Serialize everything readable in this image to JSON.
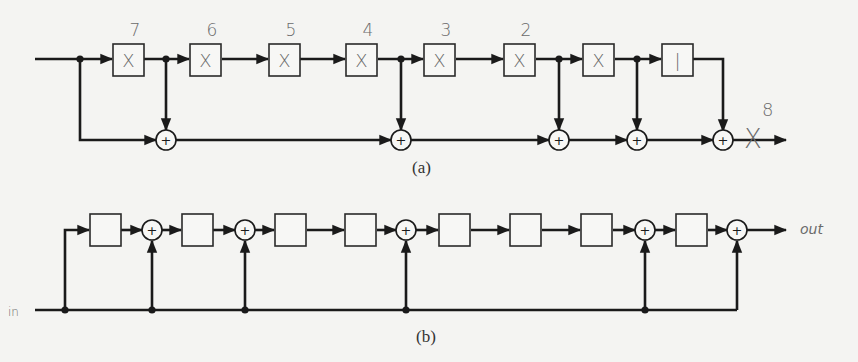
{
  "diagram_a": {
    "caption": "(a)",
    "input_y": 59,
    "bus_y": 140,
    "boxes": [
      {
        "x": 113,
        "label": "X",
        "annot": "7"
      },
      {
        "x": 190,
        "label": "X",
        "annot": "6"
      },
      {
        "x": 269,
        "label": "X",
        "annot": "5"
      },
      {
        "x": 346,
        "label": "X",
        "annot": "4"
      },
      {
        "x": 424,
        "label": "X",
        "annot": "3"
      },
      {
        "x": 504,
        "label": "X",
        "annot": "2"
      },
      {
        "x": 583,
        "label": "X",
        "annot": ""
      },
      {
        "x": 662,
        "label": "|",
        "annot": ""
      }
    ],
    "taps_x": [
      80,
      166,
      401,
      559,
      637
    ],
    "sums_x": [
      166,
      401,
      559,
      637,
      723
    ],
    "output_annotation": "X",
    "output_exponent": "8"
  },
  "diagram_b": {
    "caption": "(b)",
    "input_label": "in",
    "output_label": "out",
    "top_y": 230,
    "bottom_y": 310,
    "boxes_x": [
      90,
      182,
      275,
      345,
      439,
      510,
      581,
      676
    ],
    "sums_x": [
      152,
      245,
      406,
      645,
      737
    ],
    "tap_dots_x": [
      65,
      152,
      245,
      406,
      645
    ]
  },
  "colors": {
    "ink": "#1a1a1a",
    "pencil": "#6a6a6a",
    "paper": "#f4f4f2"
  }
}
